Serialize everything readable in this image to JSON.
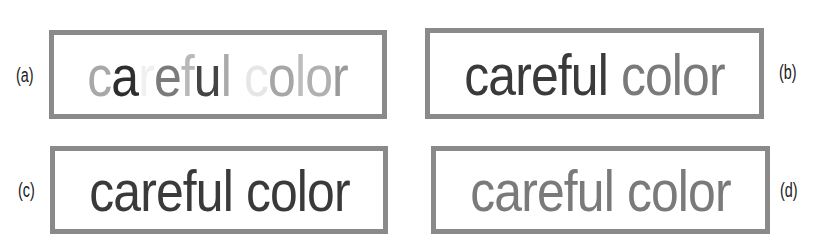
{
  "figure": {
    "panels": [
      {
        "id": "a",
        "label": "(a)",
        "text": "careful color",
        "letters": [
          {
            "ch": "c",
            "color": "#a8a8a8"
          },
          {
            "ch": "a",
            "color": "#2e2e2e"
          },
          {
            "ch": "r",
            "color": "#f0f0f0"
          },
          {
            "ch": "e",
            "color": "#7a7a7a"
          },
          {
            "ch": "f",
            "color": "#b8b8b8"
          },
          {
            "ch": "u",
            "color": "#444444"
          },
          {
            "ch": "l",
            "color": "#aaaaaa"
          },
          {
            "ch": " ",
            "color": "#ffffff"
          },
          {
            "ch": "c",
            "color": "#e6e6e6"
          },
          {
            "ch": "o",
            "color": "#a6a6a6"
          },
          {
            "ch": "l",
            "color": "#bdbdbd"
          },
          {
            "ch": "o",
            "color": "#b0b0b0"
          },
          {
            "ch": "r",
            "color": "#9a9a9a"
          }
        ]
      },
      {
        "id": "b",
        "label": "(b)",
        "words": [
          {
            "text": "careful",
            "color": "#3a3a3a"
          },
          {
            "text": " ",
            "color": "#ffffff"
          },
          {
            "text": "color",
            "color": "#7a7a7a"
          }
        ]
      },
      {
        "id": "c",
        "label": "(c)",
        "text": "careful color",
        "color": "#3a3a3a"
      },
      {
        "id": "d",
        "label": "(d)",
        "text": "careful color",
        "color": "#7a7a7a"
      }
    ],
    "border_color": "#8a8a8a"
  }
}
